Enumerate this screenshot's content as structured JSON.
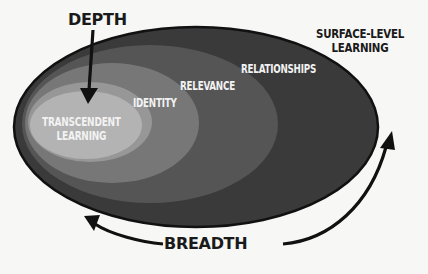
{
  "diagram": {
    "type": "nested-ellipses",
    "layers": [
      {
        "id": "surface",
        "label": "SURFACE-LEVEL\nLEARNING",
        "line1": "SURFACE-LEVEL",
        "line2": "LEARNING",
        "color": "#3a3a3a"
      },
      {
        "id": "relationships",
        "label": "RELATIONSHIPS",
        "color": "#555555"
      },
      {
        "id": "relevance",
        "label": "RELEVANCE",
        "color": "#777777"
      },
      {
        "id": "identity",
        "label": "IDENTITY",
        "color": "#979797"
      },
      {
        "id": "transcendent",
        "label": "TRANSCENDENT\nLEARNING",
        "line1": "TRANSCENDENT",
        "line2": "LEARNING",
        "color": "#b3b3b3"
      }
    ],
    "axes": {
      "depth": {
        "label": "DEPTH",
        "direction": "down"
      },
      "breadth": {
        "label": "BREADTH",
        "direction": "around"
      }
    },
    "colors": {
      "background": "#f7f7f5",
      "outline": "#111111",
      "text_inner": "#f2f2f2",
      "text_outer": "#1a1a1a"
    }
  }
}
